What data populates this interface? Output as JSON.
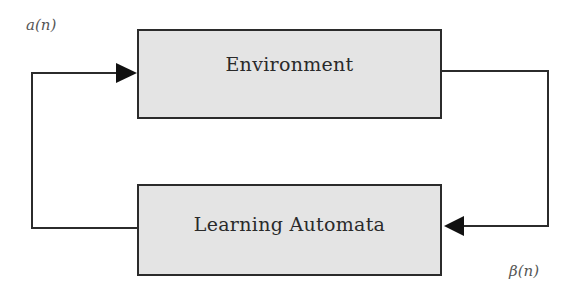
{
  "diagram": {
    "type": "feedback-loop",
    "nodes": [
      {
        "id": "environment",
        "label": "Environment"
      },
      {
        "id": "learning_automata",
        "label": "Learning Automata"
      }
    ],
    "edges": [
      {
        "from": "learning_automata",
        "to": "environment",
        "label": "a(n)",
        "route": "left"
      },
      {
        "from": "environment",
        "to": "learning_automata",
        "label": "β(n)",
        "route": "right"
      }
    ],
    "colors": {
      "box_fill": "#e4e4e4",
      "stroke": "#2b2b2b",
      "label_text": "#555555"
    }
  }
}
